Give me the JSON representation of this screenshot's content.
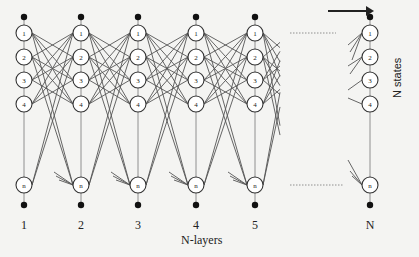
{
  "diagram": {
    "type": "layered-network",
    "layers": {
      "labels": [
        "1",
        "2",
        "3",
        "4",
        "5",
        "N"
      ],
      "axis_label": "N-layers",
      "x_positions": [
        24,
        81,
        138,
        196,
        255,
        370
      ]
    },
    "states": {
      "labels": [
        "1",
        "2",
        "3",
        "4",
        "n"
      ],
      "axis_label": "N states",
      "y_positions": [
        33,
        57,
        80,
        104,
        185
      ]
    },
    "ellipsis": ". . . . . . . .",
    "arrow": "right-arrow",
    "colors": {
      "background": "#f4f4f2",
      "line": "#555555",
      "node_stroke": "#333333",
      "node_fill": "#ffffff",
      "dot": "#111111"
    }
  }
}
